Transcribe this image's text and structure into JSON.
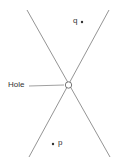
{
  "diagram": {
    "labels": {
      "hole": "Hole",
      "q": "q",
      "p": "p"
    },
    "colors": {
      "line": "#888888",
      "text": "#333333",
      "background": "#ffffff"
    }
  }
}
